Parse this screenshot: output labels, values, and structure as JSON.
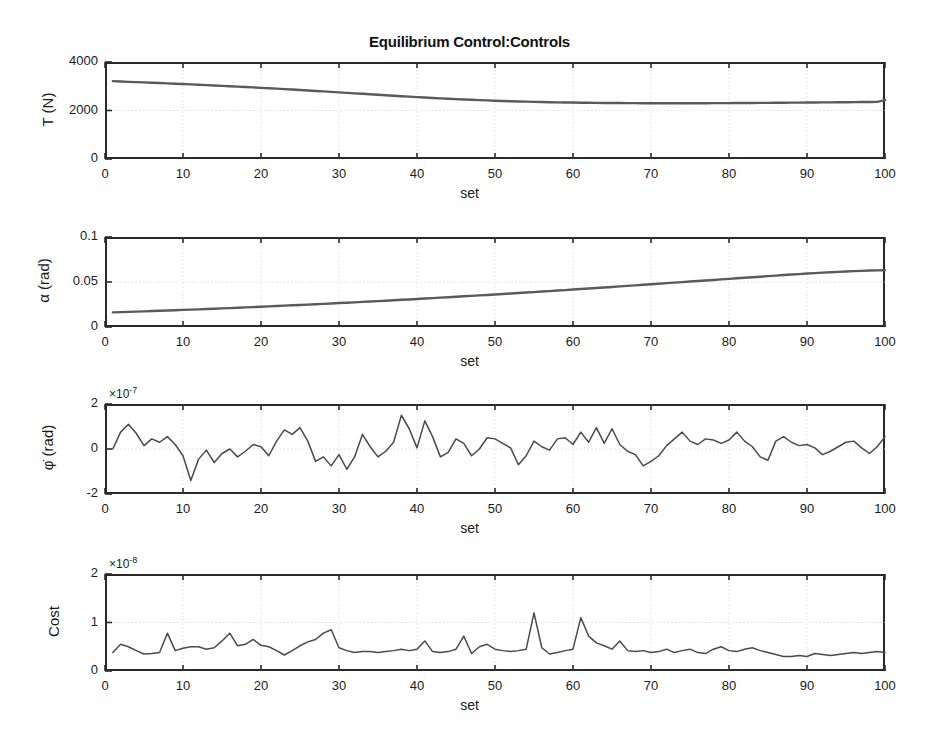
{
  "figure": {
    "title": "Equilibrium Control:Controls",
    "background": "#ffffff",
    "line_color": "#4a4a4a",
    "axis_color": "#2a2a2a",
    "grid_color": "#cfcfcf"
  },
  "chart_data": [
    {
      "type": "line",
      "title": "Equilibrium Control:Controls",
      "xlabel": "set",
      "ylabel": "T (N)",
      "xlim": [
        0,
        100
      ],
      "ylim": [
        0,
        4000
      ],
      "xticks": [
        0,
        10,
        20,
        30,
        40,
        50,
        60,
        70,
        80,
        90,
        100
      ],
      "xticklabels": [
        "0",
        "10",
        "20",
        "30",
        "40",
        "50",
        "60",
        "70",
        "80",
        "90",
        "100"
      ],
      "yticks": [
        0,
        2000,
        4000
      ],
      "yticklabels": [
        "0",
        "2000",
        "4000"
      ],
      "exponent": "",
      "grid": true,
      "legend": "none",
      "x": [
        1,
        2,
        3,
        4,
        5,
        6,
        7,
        8,
        9,
        10,
        11,
        12,
        13,
        14,
        15,
        16,
        17,
        18,
        19,
        20,
        21,
        22,
        23,
        24,
        25,
        26,
        27,
        28,
        29,
        30,
        31,
        32,
        33,
        34,
        35,
        36,
        37,
        38,
        39,
        40,
        41,
        42,
        43,
        44,
        45,
        46,
        47,
        48,
        49,
        50,
        51,
        52,
        53,
        54,
        55,
        56,
        57,
        58,
        59,
        60,
        61,
        62,
        63,
        64,
        65,
        66,
        67,
        68,
        69,
        70,
        71,
        72,
        73,
        74,
        75,
        76,
        77,
        78,
        79,
        80,
        81,
        82,
        83,
        84,
        85,
        86,
        87,
        88,
        89,
        90,
        91,
        92,
        93,
        94,
        95,
        96,
        97,
        98,
        99,
        100
      ],
      "values": [
        3210,
        3195,
        3182,
        3170,
        3158,
        3145,
        3132,
        3118,
        3104,
        3090,
        3076,
        3062,
        3047,
        3032,
        3017,
        3001,
        2985,
        2969,
        2952,
        2935,
        2918,
        2900,
        2882,
        2864,
        2845,
        2826,
        2807,
        2788,
        2768,
        2748,
        2728,
        2708,
        2688,
        2668,
        2648,
        2628,
        2609,
        2590,
        2571,
        2553,
        2535,
        2518,
        2501,
        2485,
        2470,
        2455,
        2441,
        2428,
        2416,
        2404,
        2393,
        2383,
        2374,
        2365,
        2357,
        2350,
        2343,
        2337,
        2332,
        2327,
        2322,
        2318,
        2315,
        2312,
        2309,
        2307,
        2305,
        2303,
        2302,
        2301,
        2300,
        2300,
        2300,
        2300,
        2300,
        2301,
        2302,
        2303,
        2304,
        2306,
        2308,
        2310,
        2312,
        2314,
        2316,
        2318,
        2321,
        2323,
        2326,
        2328,
        2331,
        2334,
        2336,
        2339,
        2342,
        2345,
        2348,
        2351,
        2354,
        2430
      ]
    },
    {
      "type": "line",
      "xlabel": "set",
      "ylabel": "α (rad)",
      "xlim": [
        0,
        100
      ],
      "ylim": [
        0,
        0.1
      ],
      "xticks": [
        0,
        10,
        20,
        30,
        40,
        50,
        60,
        70,
        80,
        90,
        100
      ],
      "xticklabels": [
        "0",
        "10",
        "20",
        "30",
        "40",
        "50",
        "60",
        "70",
        "80",
        "90",
        "100"
      ],
      "yticks": [
        0,
        0.05,
        0.1
      ],
      "yticklabels": [
        "0",
        "0.05",
        "0.1"
      ],
      "exponent": "",
      "grid": true,
      "legend": "none",
      "x": [
        1,
        2,
        3,
        4,
        5,
        6,
        7,
        8,
        9,
        10,
        11,
        12,
        13,
        14,
        15,
        16,
        17,
        18,
        19,
        20,
        21,
        22,
        23,
        24,
        25,
        26,
        27,
        28,
        29,
        30,
        31,
        32,
        33,
        34,
        35,
        36,
        37,
        38,
        39,
        40,
        41,
        42,
        43,
        44,
        45,
        46,
        47,
        48,
        49,
        50,
        51,
        52,
        53,
        54,
        55,
        56,
        57,
        58,
        59,
        60,
        61,
        62,
        63,
        64,
        65,
        66,
        67,
        68,
        69,
        70,
        71,
        72,
        73,
        74,
        75,
        76,
        77,
        78,
        79,
        80,
        81,
        82,
        83,
        84,
        85,
        86,
        87,
        88,
        89,
        90,
        91,
        92,
        93,
        94,
        95,
        96,
        97,
        98,
        99,
        100
      ],
      "values": [
        0.0162,
        0.0165,
        0.0168,
        0.0171,
        0.0174,
        0.0177,
        0.018,
        0.0183,
        0.0186,
        0.019,
        0.0193,
        0.0196,
        0.02,
        0.0203,
        0.0207,
        0.021,
        0.0214,
        0.0218,
        0.0221,
        0.0225,
        0.0229,
        0.0233,
        0.0237,
        0.0241,
        0.0245,
        0.0249,
        0.0253,
        0.0257,
        0.0261,
        0.0266,
        0.027,
        0.0274,
        0.0279,
        0.0283,
        0.0288,
        0.0292,
        0.0297,
        0.0302,
        0.0306,
        0.0311,
        0.0316,
        0.0321,
        0.0326,
        0.0331,
        0.0336,
        0.0341,
        0.0346,
        0.0351,
        0.0356,
        0.0361,
        0.0367,
        0.0372,
        0.0377,
        0.0383,
        0.0388,
        0.0394,
        0.0399,
        0.0405,
        0.041,
        0.0416,
        0.0422,
        0.0427,
        0.0433,
        0.0439,
        0.0445,
        0.0451,
        0.0457,
        0.0463,
        0.0469,
        0.0475,
        0.0481,
        0.0487,
        0.0493,
        0.0499,
        0.0505,
        0.0511,
        0.0517,
        0.0523,
        0.0529,
        0.0535,
        0.0541,
        0.0547,
        0.0553,
        0.0559,
        0.0565,
        0.0571,
        0.0577,
        0.0583,
        0.0588,
        0.0594,
        0.0599,
        0.0604,
        0.0609,
        0.0613,
        0.0617,
        0.0621,
        0.0624,
        0.0627,
        0.0629,
        0.0631
      ]
    },
    {
      "type": "line",
      "xlabel": "set",
      "ylabel": "φ̇ (rad)",
      "xlim": [
        0,
        100
      ],
      "ylim": [
        -2,
        2
      ],
      "xticks": [
        0,
        10,
        20,
        30,
        40,
        50,
        60,
        70,
        80,
        90,
        100
      ],
      "xticklabels": [
        "0",
        "10",
        "20",
        "30",
        "40",
        "50",
        "60",
        "70",
        "80",
        "90",
        "100"
      ],
      "yticks": [
        -2,
        0,
        2
      ],
      "yticklabels": [
        "-2",
        "0",
        "2"
      ],
      "exponent": "×10-7",
      "exponent_mantissa": "×10",
      "exponent_power": "-7",
      "grid": true,
      "legend": "none",
      "x": [
        1,
        2,
        3,
        4,
        5,
        6,
        7,
        8,
        9,
        10,
        11,
        12,
        13,
        14,
        15,
        16,
        17,
        18,
        19,
        20,
        21,
        22,
        23,
        24,
        25,
        26,
        27,
        28,
        29,
        30,
        31,
        32,
        33,
        34,
        35,
        36,
        37,
        38,
        39,
        40,
        41,
        42,
        43,
        44,
        45,
        46,
        47,
        48,
        49,
        50,
        51,
        52,
        53,
        54,
        55,
        56,
        57,
        58,
        59,
        60,
        61,
        62,
        63,
        64,
        65,
        66,
        67,
        68,
        69,
        70,
        71,
        72,
        73,
        74,
        75,
        76,
        77,
        78,
        79,
        80,
        81,
        82,
        83,
        84,
        85,
        86,
        87,
        88,
        89,
        90,
        91,
        92,
        93,
        94,
        95,
        96,
        97,
        98,
        99,
        100
      ],
      "values": [
        0.0,
        0.75,
        1.1,
        0.7,
        0.15,
        0.45,
        0.3,
        0.55,
        0.2,
        -0.3,
        -1.4,
        -0.45,
        -0.05,
        -0.6,
        -0.2,
        0.0,
        -0.35,
        -0.1,
        0.2,
        0.1,
        -0.3,
        0.35,
        0.85,
        0.65,
        0.95,
        0.35,
        -0.55,
        -0.35,
        -0.75,
        -0.25,
        -0.9,
        -0.35,
        0.65,
        0.1,
        -0.35,
        -0.1,
        0.3,
        1.5,
        0.9,
        0.05,
        1.25,
        0.55,
        -0.35,
        -0.15,
        0.45,
        0.25,
        -0.3,
        0.0,
        0.5,
        0.45,
        0.25,
        0.05,
        -0.7,
        -0.3,
        0.35,
        0.1,
        -0.05,
        0.45,
        0.5,
        0.2,
        0.75,
        0.3,
        0.95,
        0.25,
        0.9,
        0.2,
        -0.1,
        -0.25,
        -0.75,
        -0.55,
        -0.3,
        0.15,
        0.45,
        0.75,
        0.35,
        0.2,
        0.45,
        0.4,
        0.25,
        0.4,
        0.75,
        0.35,
        0.1,
        -0.35,
        -0.5,
        0.35,
        0.55,
        0.3,
        0.15,
        0.2,
        0.05,
        -0.25,
        -0.1,
        0.1,
        0.3,
        0.35,
        0.05,
        -0.2,
        0.1,
        0.55
      ]
    },
    {
      "type": "line",
      "xlabel": "set",
      "ylabel": "Cost",
      "xlim": [
        0,
        100
      ],
      "ylim": [
        0,
        2
      ],
      "xticks": [
        0,
        10,
        20,
        30,
        40,
        50,
        60,
        70,
        80,
        90,
        100
      ],
      "xticklabels": [
        "0",
        "10",
        "20",
        "30",
        "40",
        "50",
        "60",
        "70",
        "80",
        "90",
        "100"
      ],
      "yticks": [
        0,
        1,
        2
      ],
      "yticklabels": [
        "0",
        "1",
        "2"
      ],
      "exponent": "×10-8",
      "exponent_mantissa": "×10",
      "exponent_power": "-8",
      "grid": true,
      "legend": "none",
      "x": [
        1,
        2,
        3,
        4,
        5,
        6,
        7,
        8,
        9,
        10,
        11,
        12,
        13,
        14,
        15,
        16,
        17,
        18,
        19,
        20,
        21,
        22,
        23,
        24,
        25,
        26,
        27,
        28,
        29,
        30,
        31,
        32,
        33,
        34,
        35,
        36,
        37,
        38,
        39,
        40,
        41,
        42,
        43,
        44,
        45,
        46,
        47,
        48,
        49,
        50,
        51,
        52,
        53,
        54,
        55,
        56,
        57,
        58,
        59,
        60,
        61,
        62,
        63,
        64,
        65,
        66,
        67,
        68,
        69,
        70,
        71,
        72,
        73,
        74,
        75,
        76,
        77,
        78,
        79,
        80,
        81,
        82,
        83,
        84,
        85,
        86,
        87,
        88,
        89,
        90,
        91,
        92,
        93,
        94,
        95,
        96,
        97,
        98,
        99,
        100
      ],
      "values": [
        0.38,
        0.55,
        0.5,
        0.42,
        0.35,
        0.36,
        0.38,
        0.78,
        0.42,
        0.47,
        0.5,
        0.5,
        0.45,
        0.48,
        0.62,
        0.78,
        0.52,
        0.55,
        0.65,
        0.53,
        0.5,
        0.42,
        0.33,
        0.42,
        0.52,
        0.6,
        0.65,
        0.78,
        0.85,
        0.48,
        0.42,
        0.38,
        0.4,
        0.4,
        0.38,
        0.4,
        0.42,
        0.45,
        0.42,
        0.45,
        0.62,
        0.4,
        0.38,
        0.4,
        0.45,
        0.72,
        0.36,
        0.5,
        0.55,
        0.45,
        0.42,
        0.4,
        0.42,
        0.45,
        1.2,
        0.48,
        0.35,
        0.38,
        0.42,
        0.45,
        1.1,
        0.72,
        0.58,
        0.52,
        0.45,
        0.62,
        0.42,
        0.4,
        0.42,
        0.38,
        0.4,
        0.45,
        0.38,
        0.42,
        0.45,
        0.38,
        0.36,
        0.45,
        0.5,
        0.42,
        0.4,
        0.45,
        0.48,
        0.42,
        0.38,
        0.34,
        0.3,
        0.3,
        0.32,
        0.3,
        0.36,
        0.34,
        0.32,
        0.34,
        0.36,
        0.38,
        0.36,
        0.38,
        0.4,
        0.38
      ]
    }
  ]
}
